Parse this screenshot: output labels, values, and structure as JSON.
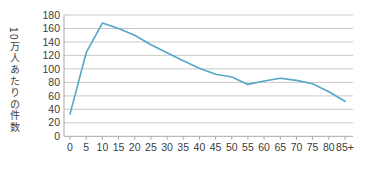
{
  "chart": {
    "y_axis_title": "10万人あたりの件数"
  },
  "chart_data": {
    "type": "line",
    "title": "",
    "xlabel": "",
    "ylabel": "10万人あたりの件数",
    "categories": [
      "0",
      "5",
      "10",
      "15",
      "20",
      "25",
      "30",
      "35",
      "40",
      "45",
      "50",
      "55",
      "60",
      "65",
      "70",
      "75",
      "80",
      "85+"
    ],
    "values": [
      33,
      124,
      168,
      160,
      150,
      136,
      124,
      112,
      101,
      92,
      88,
      77,
      82,
      86,
      83,
      78,
      66,
      52
    ],
    "ylim": [
      0,
      180
    ],
    "ytick_interval": 20,
    "grid": true,
    "legend": "none",
    "line_color": "#55a6c9",
    "grid_color": "#c9c9c9",
    "axis_color": "#a9a9a9",
    "text_color": "#3d3d3d",
    "background_color": "#ffffff"
  }
}
